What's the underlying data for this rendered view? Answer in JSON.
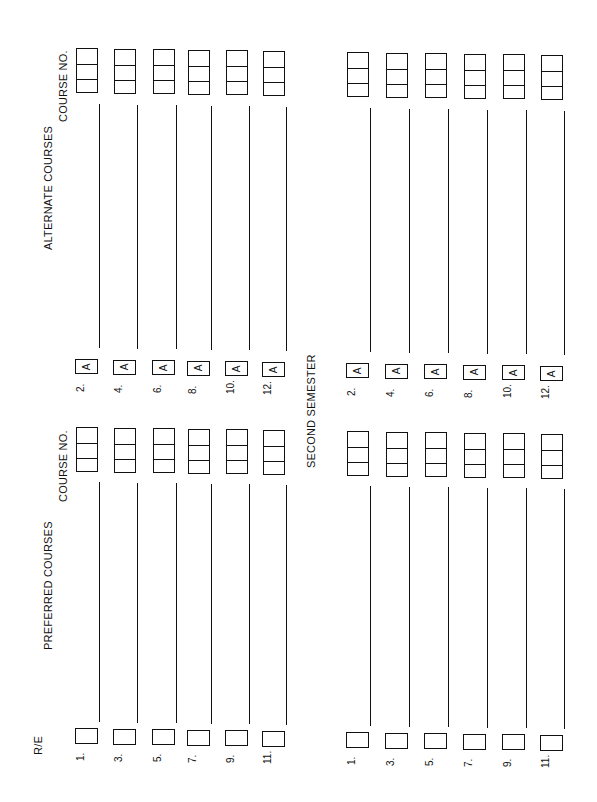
{
  "form": {
    "headers": {
      "course_no_alt": "COURSE NO.",
      "alternate_courses": "ALTERNATE COURSES",
      "course_no_pref": "COURSE NO.",
      "preferred_courses": "PREFERRED COURSES",
      "re": "R/E",
      "second_semester": "SECOND SEMESTER"
    },
    "a_label": "A",
    "first_semester": {
      "alternate_numbers": [
        "2.",
        "4.",
        "6.",
        "8.",
        "10.",
        "12."
      ],
      "preferred_numbers": [
        "1.",
        "3.",
        "5.",
        "7.",
        "9.",
        "11."
      ]
    },
    "second_semester": {
      "alternate_numbers": [
        "2.",
        "4.",
        "6.",
        "8.",
        "10.",
        "12."
      ],
      "preferred_numbers": [
        "1.",
        "3.",
        "5.",
        "7.",
        "9.",
        "11."
      ]
    }
  }
}
